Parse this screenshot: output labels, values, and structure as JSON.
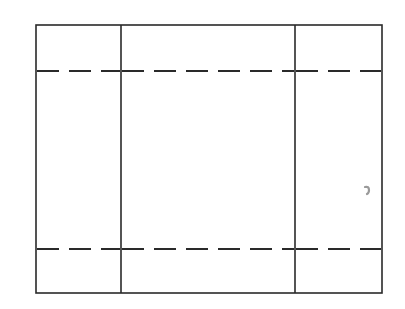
{
  "diagram": {
    "type": "box-net",
    "stroke_color": "#2a2a2a",
    "background": "#ffffff",
    "outer_rect": {
      "x": 36,
      "y": 25,
      "width": 346,
      "height": 268
    },
    "solid_dividers_x": [
      121,
      295
    ],
    "fold_lines_y": [
      71,
      249
    ],
    "dash_pattern": [
      22,
      10
    ],
    "panels": [
      {
        "name": "left-panel",
        "x1": 36,
        "x2": 121
      },
      {
        "name": "center-panel",
        "x1": 121,
        "x2": 295
      },
      {
        "name": "right-panel",
        "x1": 295,
        "x2": 382
      }
    ],
    "artifact": {
      "x": 367,
      "y": 190,
      "note": "small gray smudge"
    }
  }
}
